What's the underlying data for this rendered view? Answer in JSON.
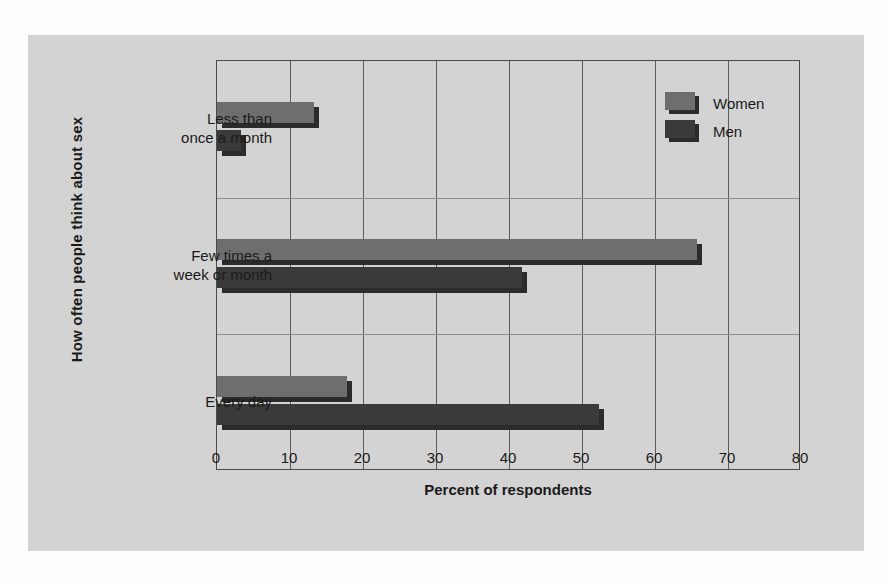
{
  "chart_data": {
    "type": "bar",
    "orientation": "horizontal",
    "title": "",
    "xlabel": "Percent of respondents",
    "ylabel": "How often people think about sex",
    "categories": [
      "Less than once a month",
      "Few times a week or month",
      "Every day"
    ],
    "category_lines": [
      [
        "Less than",
        "once a month"
      ],
      [
        "Few times a",
        "week or month"
      ],
      [
        "Every day"
      ]
    ],
    "series": [
      {
        "name": "Women",
        "color": "#6e6e6e",
        "values": [
          14,
          66.5,
          18.5
        ]
      },
      {
        "name": "Men",
        "color": "#3a3a3a",
        "values": [
          4,
          42.5,
          53
        ]
      }
    ],
    "xlim": [
      0,
      80
    ],
    "xticks": [
      0,
      10,
      20,
      30,
      40,
      50,
      60,
      70,
      80
    ],
    "xtick_labels": [
      "0",
      "10",
      "20",
      "30",
      "40",
      "50",
      "60",
      "70",
      "80"
    ],
    "grid": "vertical-major-and-category-separators",
    "legend_position": "top-right-inside",
    "background_color": "#d3d3d3",
    "page_background": "#fdfdfd",
    "axis_color": "#4a4a4a",
    "gridline_color": "#5c5c5c"
  },
  "legend": {
    "entries": [
      {
        "label": "Women",
        "key": "women"
      },
      {
        "label": "Men",
        "key": "men"
      }
    ]
  }
}
